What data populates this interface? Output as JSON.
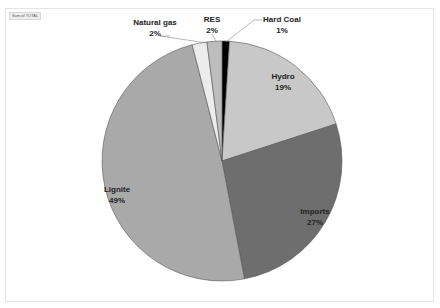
{
  "field_button": "Sum of TOTAL",
  "chart_data": {
    "type": "pie",
    "title": "",
    "categories": [
      "Hard Coal",
      "Hydro",
      "Imports",
      "Lignite",
      "Natural gas",
      "RES"
    ],
    "values": [
      1,
      19,
      27,
      49,
      2,
      2
    ],
    "value_labels": [
      "1%",
      "19%",
      "27%",
      "49%",
      "2%",
      "2%"
    ],
    "colors": [
      "#000000",
      "#c8c8c8",
      "#6e6e6e",
      "#a9a9a9",
      "#ececec",
      "#bdbdbd"
    ],
    "start_angle": "12 o'clock, clockwise",
    "legend": "none (data labels)"
  },
  "labels": {
    "hard_coal": {
      "name": "Hard Coal",
      "pct": "1%"
    },
    "hydro": {
      "name": "Hydro",
      "pct": "19%"
    },
    "imports": {
      "name": "Imports",
      "pct": "27%"
    },
    "lignite": {
      "name": "Lignite",
      "pct": "49%"
    },
    "natural_gas": {
      "name": "Natural gas",
      "pct": "2%"
    },
    "res": {
      "name": "RES",
      "pct": "2%"
    }
  }
}
